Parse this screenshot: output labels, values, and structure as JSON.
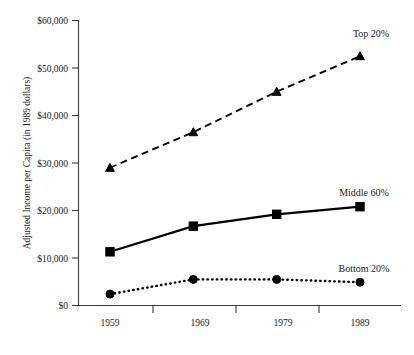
{
  "chart_data": {
    "type": "line",
    "title": "",
    "xlabel": "",
    "ylabel": "Adjusted Income per Capita (in 1989 dollars)",
    "categories": [
      "1959",
      "1969",
      "1979",
      "1989"
    ],
    "x": [
      1959,
      1969,
      1979,
      1989
    ],
    "ylim": [
      0,
      60000
    ],
    "ytick_values": [
      0,
      10000,
      20000,
      30000,
      40000,
      50000,
      60000
    ],
    "ytick_labels": [
      "$0",
      "$10,000",
      "$20,000",
      "$30,000",
      "$40,000",
      "$50,000",
      "$60,000"
    ],
    "grid": false,
    "legend_position": "inline-right-of-series",
    "series": [
      {
        "name": "Top 20%",
        "values": [
          29000,
          36500,
          45000,
          52500
        ],
        "marker": "triangle",
        "line_style": "dashed",
        "color": "#000000",
        "label_text": "Top 20%"
      },
      {
        "name": "Middle 60%",
        "values": [
          11300,
          16700,
          19200,
          20800
        ],
        "marker": "square",
        "line_style": "solid",
        "color": "#000000",
        "label_text": "Middle 60%"
      },
      {
        "name": "Bottom 20%",
        "values": [
          2400,
          5500,
          5500,
          4900
        ],
        "marker": "circle",
        "line_style": "dotted",
        "color": "#000000",
        "label_text": "Bottom 20%"
      }
    ],
    "annotations": []
  },
  "axes": {
    "y_title": "Adjusted Income per Capita (in 1989 dollars)",
    "y_ticks": [
      {
        "label": "$60,000",
        "value": 60000
      },
      {
        "label": "$50,000",
        "value": 50000
      },
      {
        "label": "$40,000",
        "value": 40000
      },
      {
        "label": "$30,000",
        "value": 30000
      },
      {
        "label": "$20,000",
        "value": 20000
      },
      {
        "label": "$10,000",
        "value": 10000
      },
      {
        "label": "$0",
        "value": 0
      }
    ],
    "x_ticks": [
      {
        "label": "1959"
      },
      {
        "label": "1969"
      },
      {
        "label": "1979"
      },
      {
        "label": "1989"
      }
    ]
  },
  "series_labels": {
    "top": "Top 20%",
    "middle": "Middle 60%",
    "bottom": "Bottom 20%"
  }
}
